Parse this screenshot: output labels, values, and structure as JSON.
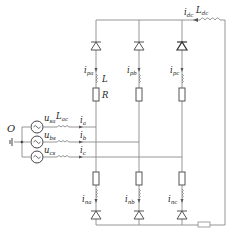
{
  "diagram": {
    "type": "MMC-like three-phase rectifier circuit",
    "source_node": "O",
    "sources": [
      {
        "id": "a",
        "voltage_label": "u",
        "voltage_sub": "sa",
        "inductor_label": "L",
        "inductor_sub": "ac",
        "current_label": "i",
        "current_sub": "a"
      },
      {
        "id": "b",
        "voltage_label": "u",
        "voltage_sub": "bs",
        "current_label": "i",
        "current_sub": "b"
      },
      {
        "id": "c",
        "voltage_label": "u",
        "voltage_sub": "cs",
        "current_label": "i",
        "current_sub": "c"
      }
    ],
    "upper_arms": [
      {
        "current_label": "i",
        "current_sub": "pa",
        "inductor_label": "L",
        "resistor_label": "R"
      },
      {
        "current_label": "i",
        "current_sub": "pb"
      },
      {
        "current_label": "i",
        "current_sub": "pc"
      }
    ],
    "lower_arms": [
      {
        "current_label": "i",
        "current_sub": "na"
      },
      {
        "current_label": "i",
        "current_sub": "nb"
      },
      {
        "current_label": "i",
        "current_sub": "nc"
      }
    ],
    "dc_side": {
      "current_label": "i",
      "current_sub": "dc",
      "inductor_label": "L",
      "inductor_sub": "dc"
    }
  }
}
